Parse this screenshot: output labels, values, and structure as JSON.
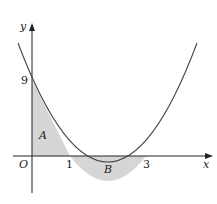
{
  "diagram": {
    "type": "function-graph",
    "curve": "y = 3x^2 - 12x + 9",
    "axes": {
      "x_label": "x",
      "y_label": "y",
      "origin_label": "O"
    },
    "ticks": {
      "y_intercept": "9",
      "root1": "1",
      "root2": "3"
    },
    "regions": [
      {
        "label": "A",
        "description": "shaded area between curve, y-axis and x-axis from x=0 to x=1"
      },
      {
        "label": "B",
        "description": "shaded area between curve and x-axis from x=1 to x=3"
      }
    ],
    "colors": {
      "curve": "#444444",
      "axes": "#222222",
      "shade": "#d6d6d6"
    }
  }
}
